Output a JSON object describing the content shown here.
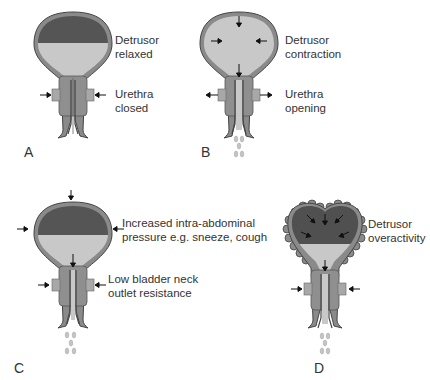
{
  "figure": {
    "colors": {
      "wall": "#8a8a8a",
      "wall_edge": "#444444",
      "urine_dark": "#555555",
      "urine_light": "#c8c8c8",
      "sphincter": "#8f8f8f",
      "droplet": "#bdbdbd",
      "arrow": "#111111",
      "text": "#333333"
    },
    "panels": [
      {
        "id": "A",
        "letter": "A",
        "bladder_label_line1": "Detrusor",
        "bladder_label_line2": "relaxed",
        "urethra_label_line1": "Urethra",
        "urethra_label_line2": "closed",
        "state": "filling",
        "leak": false
      },
      {
        "id": "B",
        "letter": "B",
        "bladder_label_line1": "Detrusor",
        "bladder_label_line2": "contraction",
        "urethra_label_line1": "Urethra",
        "urethra_label_line2": "opening",
        "state": "voiding",
        "leak": true
      },
      {
        "id": "C",
        "letter": "C",
        "bladder_label_line1": "Increased intra-abdominal",
        "bladder_label_line2": "pressure e.g. sneeze, cough",
        "urethra_label_line1": "Low bladder neck",
        "urethra_label_line2": "outlet resistance",
        "state": "stress incontinence",
        "leak": true
      },
      {
        "id": "D",
        "letter": "D",
        "bladder_label_line1": "Detrusor",
        "bladder_label_line2": "overactivity",
        "state": "urge incontinence",
        "leak": true
      }
    ]
  }
}
